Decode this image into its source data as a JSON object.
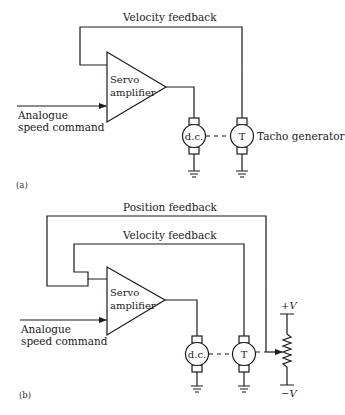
{
  "panel_a": {
    "tag": "(a)",
    "velocity_feedback_label": "Velocity feedback",
    "amplifier_label_line1": "Servo",
    "amplifier_label_line2": "amplifier",
    "input_label_line1": "Analogue",
    "input_label_line2": "speed command",
    "motor_label": "d.c.",
    "tacho_label": "T",
    "tacho_caption": "Tacho generator"
  },
  "panel_b": {
    "tag": "(b)",
    "position_feedback_label": "Position feedback",
    "velocity_feedback_label": "Velocity feedback",
    "amplifier_label_line1": "Servo",
    "amplifier_label_line2": "amplifier",
    "input_label_line1": "Analogue",
    "input_label_line2": "speed command",
    "motor_label": "d.c.",
    "tacho_label": "T",
    "pot_plus_label": "+V",
    "pot_minus_label": "−V"
  }
}
